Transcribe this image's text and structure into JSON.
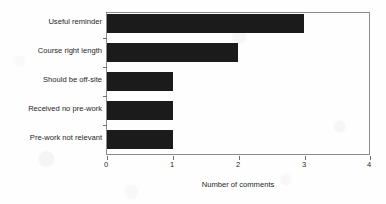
{
  "chart_data": {
    "type": "bar",
    "orientation": "horizontal",
    "title": "",
    "xlabel": "Number of comments",
    "ylabel": "",
    "categories": [
      "Useful reminder",
      "Course right length",
      "Should be off-site",
      "Received no pre-work",
      "Pre-work not relevant"
    ],
    "values": [
      3,
      2,
      1,
      1,
      1
    ],
    "xlim": [
      0,
      4
    ],
    "xticks": [
      "0",
      "1",
      "2",
      "3",
      "4"
    ],
    "xtick_values": [
      0,
      1,
      2,
      3,
      4
    ],
    "grid": false,
    "legend": false,
    "bar_color": "#1b1b1b",
    "frame_color": "#8a8a8a",
    "background_color": "#ffffff"
  }
}
